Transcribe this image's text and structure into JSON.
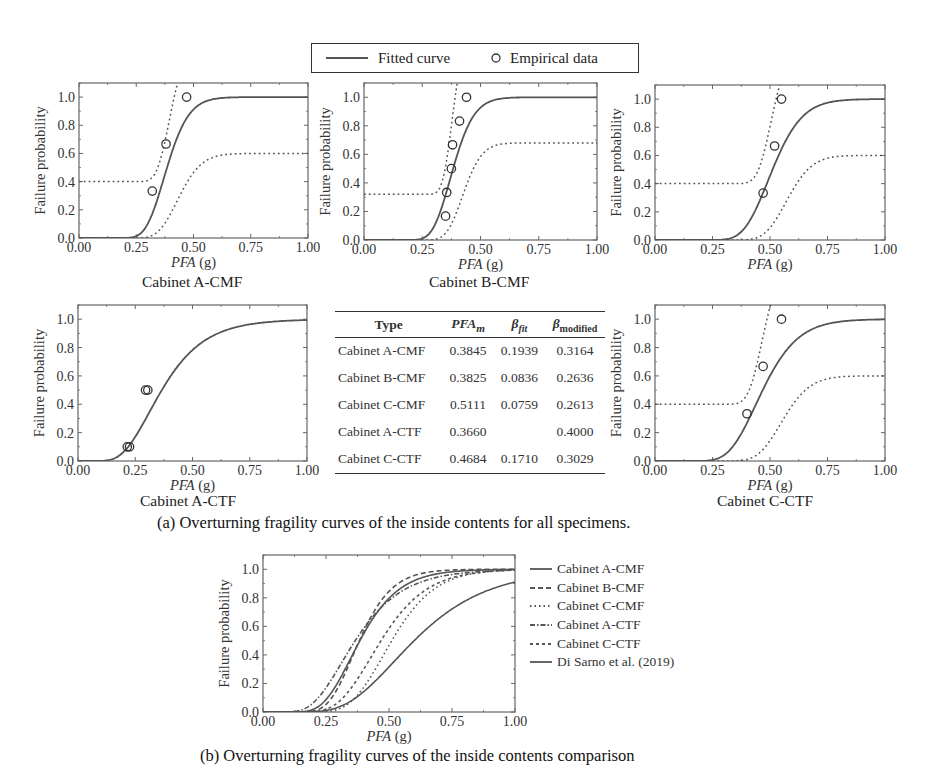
{
  "legend": {
    "fitted_label": "Fitted curve",
    "empirical_label": "Empirical data"
  },
  "axes": {
    "ylabel": "Failure probability",
    "xlabel_italic": "PFA",
    "xlabel_unit": " (g)",
    "xticks": [
      "0.00",
      "0.25",
      "0.50",
      "0.75",
      "1.00"
    ],
    "yticks": [
      "0.0",
      "0.2",
      "0.4",
      "0.6",
      "0.8",
      "1.0"
    ]
  },
  "panels": {
    "a_cmf": {
      "title": "Cabinet A-CMF"
    },
    "b_cmf": {
      "title": "Cabinet B-CMF"
    },
    "c_cmf": {
      "title": ""
    },
    "a_ctf": {
      "title": "Cabinet A-CTF"
    },
    "c_ctf": {
      "title": "Cabinet C-CTF"
    }
  },
  "table": {
    "headers": {
      "type": "Type",
      "pfa": "PFA",
      "pfa_sub": "m",
      "bfit": "β",
      "bfit_sub": "fit",
      "bmod": "β",
      "bmod_sub": "modified"
    },
    "rows": [
      {
        "type": "Cabinet A-CMF",
        "pfa_m": "0.3845",
        "beta_fit": "0.1939",
        "beta_modified": "0.3164"
      },
      {
        "type": "Cabinet B-CMF",
        "pfa_m": "0.3825",
        "beta_fit": "0.0836",
        "beta_modified": "0.2636"
      },
      {
        "type": "Cabinet C-CMF",
        "pfa_m": "0.5111",
        "beta_fit": "0.0759",
        "beta_modified": "0.2613"
      },
      {
        "type": "Cabinet A-CTF",
        "pfa_m": "0.3660",
        "beta_fit": "",
        "beta_modified": "0.4000"
      },
      {
        "type": "Cabinet C-CTF",
        "pfa_m": "0.4684",
        "beta_fit": "0.1710",
        "beta_modified": "0.3029"
      }
    ]
  },
  "captions": {
    "a": "(a) Overturning fragility curves of the inside contents for all specimens.",
    "b": "(b) Overturning fragility curves of the inside contents comparison"
  },
  "comparison_legend": [
    {
      "label": "Cabinet A-CMF",
      "style": "solid"
    },
    {
      "label": "Cabinet B-CMF",
      "style": "dashed"
    },
    {
      "label": "Cabinet C-CMF",
      "style": "dotted"
    },
    {
      "label": "Cabinet A-CTF",
      "style": "dash-dot"
    },
    {
      "label": "Cabinet C-CTF",
      "style": "short-dash"
    },
    {
      "label": "Di Sarno et al. (2019)",
      "style": "solid"
    }
  ],
  "colors": {
    "curve": "#555555",
    "axis": "#555555",
    "text": "#333333"
  },
  "chart_data": [
    {
      "type": "line",
      "title": "Cabinet A-CMF",
      "xlabel": "PFA (g)",
      "ylabel": "Failure probability",
      "xlim": [
        0,
        1
      ],
      "ylim": [
        0,
        1.1
      ],
      "fitted": {
        "median": 0.3845,
        "beta": 0.1939
      },
      "bounds": {
        "lower_plateau": 0.4,
        "upper_plateau": 0.6
      },
      "empirical": {
        "x": [
          0.32,
          0.38,
          0.47
        ],
        "y": [
          0.333,
          0.667,
          1.0
        ]
      }
    },
    {
      "type": "line",
      "title": "Cabinet B-CMF",
      "xlabel": "PFA (g)",
      "ylabel": "Failure probability",
      "xlim": [
        0,
        1
      ],
      "ylim": [
        0,
        1.1
      ],
      "fitted": {
        "median": 0.3825,
        "beta": 0.0836
      },
      "bounds": {
        "lower_plateau": 0.32,
        "upper_plateau": 0.68
      },
      "empirical": {
        "x": [
          0.35,
          0.355,
          0.375,
          0.38,
          0.41,
          0.44
        ],
        "y": [
          0.167,
          0.333,
          0.5,
          0.667,
          0.833,
          1.0
        ]
      }
    },
    {
      "type": "line",
      "title": "Cabinet C-CMF",
      "xlabel": "PFA (g)",
      "ylabel": "Failure probability",
      "xlim": [
        0,
        1
      ],
      "ylim": [
        0,
        1.1
      ],
      "fitted": {
        "median": 0.5111,
        "beta": 0.0759
      },
      "bounds": {
        "lower_plateau": 0.4,
        "upper_plateau": 0.6
      },
      "empirical": {
        "x": [
          0.47,
          0.52,
          0.55
        ],
        "y": [
          0.333,
          0.667,
          1.0
        ]
      }
    },
    {
      "type": "line",
      "title": "Cabinet A-CTF",
      "xlabel": "PFA (g)",
      "ylabel": "Failure probability",
      "xlim": [
        0,
        1
      ],
      "ylim": [
        0,
        1.1
      ],
      "fitted": {
        "median": 0.366,
        "beta": 0.4
      },
      "empirical": {
        "x": [
          0.215,
          0.225,
          0.295,
          0.305
        ],
        "y": [
          0.1,
          0.1,
          0.5,
          0.5
        ]
      }
    },
    {
      "type": "line",
      "title": "Cabinet C-CTF",
      "xlabel": "PFA (g)",
      "ylabel": "Failure probability",
      "xlim": [
        0,
        1
      ],
      "ylim": [
        0,
        1.1
      ],
      "fitted": {
        "median": 0.4684,
        "beta": 0.171
      },
      "bounds": {
        "lower_plateau": 0.4,
        "upper_plateau": 0.6
      },
      "empirical": {
        "x": [
          0.4,
          0.47,
          0.55
        ],
        "y": [
          0.333,
          0.667,
          1.0
        ]
      }
    },
    {
      "type": "line",
      "title": "Overturning fragility curves comparison",
      "xlabel": "PFA (g)",
      "ylabel": "Failure probability",
      "xlim": [
        0,
        1
      ],
      "ylim": [
        0,
        1.1
      ],
      "x": [
        0.0,
        0.1,
        0.2,
        0.25,
        0.3,
        0.35,
        0.4,
        0.45,
        0.5,
        0.55,
        0.6,
        0.7,
        0.8,
        0.9,
        1.0
      ],
      "series": [
        {
          "name": "Cabinet A-CMF",
          "median": 0.3845,
          "beta": 0.3164
        },
        {
          "name": "Cabinet B-CMF",
          "median": 0.3825,
          "beta": 0.2636
        },
        {
          "name": "Cabinet C-CMF",
          "median": 0.5111,
          "beta": 0.2613
        },
        {
          "name": "Cabinet A-CTF",
          "median": 0.366,
          "beta": 0.4
        },
        {
          "name": "Cabinet C-CTF",
          "median": 0.4684,
          "beta": 0.3029
        },
        {
          "name": "Di Sarno et al. (2019)",
          "median": 0.6,
          "beta": 0.38
        }
      ],
      "legend_position": "right"
    }
  ]
}
